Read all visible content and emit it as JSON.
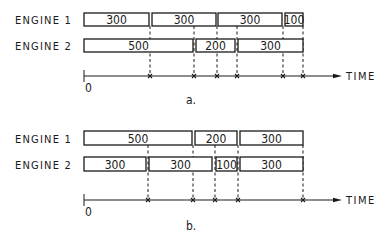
{
  "axis_label": "TIME",
  "origin_label": "0",
  "diagrams": [
    {
      "caption": "a.",
      "engines": [
        {
          "label": "ENGINE 1",
          "blocks": [
            {
              "value": "300",
              "x1": 84,
              "x2": 149
            },
            {
              "value": "300",
              "x1": 152,
              "x2": 216
            },
            {
              "value": "300",
              "x1": 218,
              "x2": 282
            },
            {
              "value": "100",
              "x1": 285,
              "x2": 303
            }
          ]
        },
        {
          "label": "ENGINE 2",
          "blocks": [
            {
              "value": "500",
              "x1": 84,
              "x2": 193
            },
            {
              "value": "200",
              "x1": 196,
              "x2": 235
            },
            {
              "value": "300",
              "x1": 238,
              "x2": 303
            }
          ]
        }
      ],
      "markers": [
        150,
        194,
        217,
        237,
        283,
        303
      ]
    },
    {
      "caption": "b.",
      "engines": [
        {
          "label": "ENGINE 1",
          "blocks": [
            {
              "value": "500",
              "x1": 84,
              "x2": 192
            },
            {
              "value": "200",
              "x1": 195,
              "x2": 237
            },
            {
              "value": "300",
              "x1": 240,
              "x2": 303
            }
          ]
        },
        {
          "label": "ENGINE 2",
          "blocks": [
            {
              "value": "300",
              "x1": 84,
              "x2": 146
            },
            {
              "value": "300",
              "x1": 149,
              "x2": 212
            },
            {
              "value": "100",
              "x1": 216,
              "x2": 237
            },
            {
              "value": "300",
              "x1": 240,
              "x2": 303
            }
          ]
        }
      ],
      "markers": [
        148,
        193,
        215,
        238,
        303
      ]
    }
  ],
  "layout": {
    "diagrams": [
      {
        "row_y": [
          13,
          39
        ],
        "row_h": 13,
        "label_y": [
          24,
          50
        ],
        "axis_y": 76,
        "tick_top": 70,
        "tick_bot": 82,
        "zero_y": 92,
        "caption_x": 186,
        "caption_y": 104
      },
      {
        "row_y": [
          131,
          157
        ],
        "row_h": 14,
        "label_y": [
          143,
          169
        ],
        "axis_y": 200,
        "tick_top": 194,
        "tick_bot": 206,
        "zero_y": 216,
        "caption_x": 186,
        "caption_y": 230
      }
    ],
    "label_x": 15,
    "axis_x0": 84,
    "axis_x1": 342,
    "time_x": 346
  }
}
